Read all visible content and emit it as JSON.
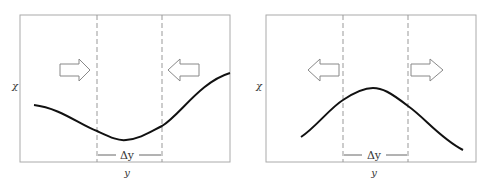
{
  "panels": [
    {
      "id": "left",
      "y_label": "χ",
      "x_label": "y",
      "interval_label": "Δy",
      "curve": "minimum",
      "arrows": "inward"
    },
    {
      "id": "right",
      "y_label": "χ",
      "x_label": "y",
      "interval_label": "Δy",
      "curve": "maximum",
      "arrows": "outward"
    }
  ],
  "colors": {
    "frame": "#999999",
    "curve": "#111111",
    "dash": "#999999",
    "arrow": "#888888"
  }
}
